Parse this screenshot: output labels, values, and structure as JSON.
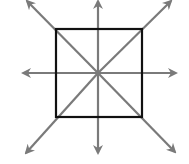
{
  "diagram": {
    "colors": {
      "background": "#ffffff",
      "square_stroke": "#111111",
      "arrow_stroke": "#7a7a7a"
    },
    "square": {
      "x": 56,
      "y": 29,
      "width": 86,
      "height": 88
    },
    "center": {
      "x": 98,
      "y": 73
    },
    "arrows": [
      {
        "name": "arrow-up",
        "from": [
          98,
          160
        ],
        "to": [
          98,
          1
        ]
      },
      {
        "name": "arrow-down",
        "from": [
          98,
          1
        ],
        "to": [
          98,
          153
        ]
      },
      {
        "name": "arrow-left",
        "from": [
          170,
          73
        ],
        "to": [
          23,
          73
        ]
      },
      {
        "name": "arrow-right",
        "from": [
          26,
          73
        ],
        "to": [
          176,
          73
        ]
      },
      {
        "name": "arrow-nw",
        "from": [
          98,
          73
        ],
        "to": [
          27,
          1
        ]
      },
      {
        "name": "arrow-ne",
        "from": [
          98,
          73
        ],
        "to": [
          171,
          1
        ]
      },
      {
        "name": "arrow-sw",
        "from": [
          98,
          73
        ],
        "to": [
          26,
          153
        ]
      },
      {
        "name": "arrow-se",
        "from": [
          98,
          73
        ],
        "to": [
          175,
          152
        ]
      }
    ]
  }
}
